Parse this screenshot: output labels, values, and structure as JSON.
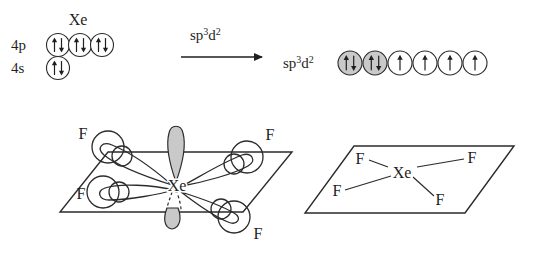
{
  "diagram": {
    "colors": {
      "ink": "#1f1f1f",
      "line": "#2b2b2b",
      "orbital_fill_gray": "#c9c9c9",
      "lone_pair_gray": "#c9c9c9",
      "background": "#ffffff"
    }
  },
  "orbital_diagram": {
    "ground_state": {
      "atom_label": "Xe",
      "rows": [
        {
          "shell_label": "4p",
          "boxes": [
            {
              "fill": "white",
              "electrons": "up-down"
            },
            {
              "fill": "white",
              "electrons": "up-down"
            },
            {
              "fill": "white",
              "electrons": "up-down"
            }
          ]
        },
        {
          "shell_label": "4s",
          "boxes": [
            {
              "fill": "white",
              "electrons": "up-down"
            }
          ]
        }
      ]
    },
    "reaction_arrow": {
      "label_base": "sp",
      "label_sup1": "3",
      "label_mid": "d",
      "label_sup2": "2",
      "direction": "right"
    },
    "hybrid_state": {
      "label_base": "sp",
      "label_sup1": "3",
      "label_mid": "d",
      "label_sup2": "2",
      "boxes": [
        {
          "fill": "gray",
          "electrons": "up-down"
        },
        {
          "fill": "gray",
          "electrons": "up-down"
        },
        {
          "fill": "white",
          "electrons": "up"
        },
        {
          "fill": "white",
          "electrons": "up"
        },
        {
          "fill": "white",
          "electrons": "up"
        },
        {
          "fill": "white",
          "electrons": "up"
        }
      ]
    }
  },
  "orbital_overlap_structure": {
    "center_atom": "Xe",
    "ligand_labels": [
      "F",
      "F",
      "F",
      "F"
    ],
    "lone_pair_count": 2,
    "lone_pair_positions": [
      "above-plane",
      "below-plane"
    ],
    "geometry": "square planar"
  },
  "shape_structure": {
    "center_atom": "Xe",
    "ligand_labels": [
      "F",
      "F",
      "F",
      "F"
    ],
    "geometry": "square planar"
  }
}
